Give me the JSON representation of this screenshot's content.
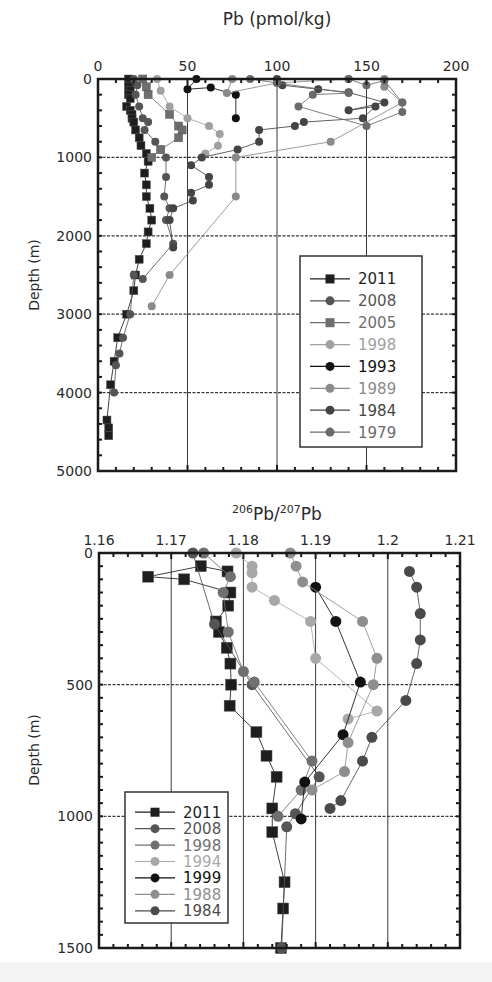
{
  "chart_data": [
    {
      "type": "line",
      "title": "Pb (pmol/kg)",
      "xlabel": "Pb (pmol/kg)",
      "ylabel": "Depth (m)",
      "xlim": [
        0,
        200
      ],
      "ylim": [
        5000,
        0
      ],
      "xticks": [
        0,
        50,
        100,
        150,
        200
      ],
      "yticks": [
        0,
        1000,
        2000,
        3000,
        4000,
        5000
      ],
      "grid": true,
      "legend_position": "lower right inside",
      "frame": {
        "left": 98,
        "top": 79,
        "right": 456,
        "bottom": 471
      },
      "legend_box": {
        "left": 300,
        "top": 256,
        "right": 422,
        "bottom": 447
      },
      "series": [
        {
          "name": "2011",
          "marker": "square",
          "color": "#1e1e1e",
          "points": [
            [
              17,
              0
            ],
            [
              18,
              50
            ],
            [
              17,
              100
            ],
            [
              18,
              150
            ],
            [
              17,
              200
            ],
            [
              18,
              250
            ],
            [
              16,
              350
            ],
            [
              18,
              400
            ],
            [
              19,
              450
            ],
            [
              19,
              500
            ],
            [
              20,
              550
            ],
            [
              21,
              650
            ],
            [
              23,
              750
            ],
            [
              24,
              850
            ],
            [
              27,
              950
            ],
            [
              28,
              1050
            ],
            [
              26,
              1200
            ],
            [
              27,
              1350
            ],
            [
              27,
              1500
            ],
            [
              29,
              1650
            ],
            [
              30,
              1800
            ],
            [
              28,
              1950
            ],
            [
              27,
              2100
            ],
            [
              23,
              2300
            ],
            [
              21,
              2500
            ],
            [
              20,
              2700
            ],
            [
              16,
              3000
            ],
            [
              11,
              3300
            ],
            [
              9,
              3600
            ],
            [
              7,
              3900
            ],
            [
              5,
              4350
            ],
            [
              6,
              4450
            ],
            [
              6,
              4550
            ]
          ]
        },
        {
          "name": "2008",
          "marker": "circle",
          "color": "#555555",
          "points": [
            [
              20,
              0
            ],
            [
              22,
              80
            ],
            [
              21,
              200
            ],
            [
              23,
              350
            ],
            [
              25,
              500
            ],
            [
              28,
              550
            ],
            [
              26,
              650
            ],
            [
              32,
              800
            ],
            [
              35,
              900
            ],
            [
              38,
              1000
            ],
            [
              38,
              1250
            ],
            [
              37,
              1500
            ],
            [
              40,
              1650
            ],
            [
              38,
              1800
            ],
            [
              42,
              2100
            ],
            [
              25,
              2550
            ],
            [
              20,
              2500
            ],
            [
              18,
              3000
            ],
            [
              14,
              3300
            ],
            [
              12,
              3500
            ],
            [
              10,
              3650
            ],
            [
              9,
              4000
            ]
          ]
        },
        {
          "name": "2005",
          "marker": "square",
          "color": "#6e6e6e",
          "points": [
            [
              25,
              0
            ],
            [
              27,
              100
            ],
            [
              28,
              200
            ],
            [
              40,
              450
            ],
            [
              45,
              600
            ],
            [
              47,
              650
            ],
            [
              45,
              750
            ],
            [
              35,
              900
            ],
            [
              30,
              1000
            ]
          ]
        },
        {
          "name": "1998",
          "marker": "circle",
          "color": "#a0a0a0",
          "points": [
            [
              33,
              0
            ],
            [
              35,
              150
            ],
            [
              40,
              350
            ],
            [
              50,
              500
            ],
            [
              62,
              600
            ],
            [
              68,
              700
            ],
            [
              67,
              850
            ],
            [
              60,
              950
            ]
          ]
        },
        {
          "name": "1993",
          "marker": "circle",
          "color": "#111111",
          "points": [
            [
              55,
              0
            ],
            [
              50,
              130
            ],
            [
              63,
              110
            ],
            [
              77,
              200
            ],
            [
              77,
              500
            ]
          ]
        },
        {
          "name": "1989",
          "marker": "circle",
          "color": "#8a8a8a",
          "points": [
            [
              75,
              0
            ],
            [
              72,
              180
            ],
            [
              100,
              50
            ],
            [
              140,
              0
            ],
            [
              160,
              0
            ],
            [
              160,
              100
            ],
            [
              170,
              300
            ],
            [
              130,
              800
            ],
            [
              77,
              1000
            ],
            [
              77,
              1500
            ],
            [
              40,
              2500
            ],
            [
              30,
              2900
            ]
          ]
        },
        {
          "name": "1984",
          "marker": "circle",
          "color": "#444444",
          "points": [
            [
              100,
              0
            ],
            [
              103,
              80
            ],
            [
              123,
              130
            ],
            [
              140,
              170
            ],
            [
              160,
              300
            ],
            [
              140,
              400
            ],
            [
              155,
              350
            ],
            [
              148,
              500
            ],
            [
              115,
              550
            ],
            [
              110,
              600
            ],
            [
              90,
              650
            ],
            [
              90,
              800
            ],
            [
              78,
              900
            ],
            [
              58,
              1000
            ],
            [
              52,
              1100
            ],
            [
              62,
              1250
            ],
            [
              62,
              1350
            ],
            [
              52,
              1450
            ],
            [
              53,
              1550
            ],
            [
              42,
              1650
            ],
            [
              40,
              1800
            ],
            [
              42,
              2150
            ]
          ]
        },
        {
          "name": "1979",
          "marker": "circle",
          "color": "#6a6a6a",
          "points": [
            [
              140,
              0
            ],
            [
              150,
              80
            ],
            [
              160,
              20
            ],
            [
              170,
              300
            ],
            [
              170,
              420
            ],
            [
              150,
              600
            ],
            [
              112,
              350
            ],
            [
              120,
              200
            ],
            [
              140,
              180
            ],
            [
              100,
              50
            ],
            [
              85,
              0
            ]
          ]
        }
      ]
    },
    {
      "type": "line",
      "title": "206Pb/207Pb",
      "xlabel": "206Pb/207Pb",
      "ylabel": "Depth (m)",
      "xlim": [
        1.16,
        1.21
      ],
      "ylim": [
        1500,
        0
      ],
      "xticks": [
        1.16,
        1.17,
        1.18,
        1.19,
        1.2,
        1.21
      ],
      "xtick_labels": [
        "1.16",
        "1.17",
        "1.18",
        "1.19",
        "1.2",
        "1.21"
      ],
      "yticks": [
        0,
        500,
        1000,
        1500
      ],
      "grid": true,
      "legend_position": "lower left inside",
      "frame": {
        "left": 99,
        "top": 553,
        "right": 460,
        "bottom": 948
      },
      "legend_box": {
        "left": 125,
        "top": 792,
        "right": 228,
        "bottom": 923
      },
      "series": [
        {
          "name": "2011",
          "marker": "square",
          "color": "#1e1e1e",
          "points": [
            [
              1.1778,
              70
            ],
            [
              1.1741,
              50
            ],
            [
              1.1668,
              90
            ],
            [
              1.1718,
              100
            ],
            [
              1.1782,
              150
            ],
            [
              1.1779,
              200
            ],
            [
              1.1762,
              260
            ],
            [
              1.1766,
              300
            ],
            [
              1.1777,
              360
            ],
            [
              1.1782,
              420
            ],
            [
              1.1783,
              500
            ],
            [
              1.1781,
              580
            ],
            [
              1.1818,
              680
            ],
            [
              1.1832,
              770
            ],
            [
              1.1846,
              850
            ],
            [
              1.184,
              970
            ],
            [
              1.184,
              1060
            ],
            [
              1.1857,
              1250
            ],
            [
              1.1855,
              1350
            ],
            [
              1.1852,
              1500
            ]
          ]
        },
        {
          "name": "2008",
          "marker": "circle",
          "color": "#555555",
          "points": [
            [
              1.173,
              0
            ],
            [
              1.176,
              270
            ],
            [
              1.1812,
              500
            ],
            [
              1.1905,
              850
            ],
            [
              1.1872,
              990
            ],
            [
              1.186,
              1040
            ],
            [
              1.1853,
              1500
            ]
          ]
        },
        {
          "name": "1998",
          "marker": "circle",
          "color": "#707070",
          "points": [
            [
              1.1745,
              0
            ],
            [
              1.1782,
              90
            ],
            [
              1.1772,
              150
            ],
            [
              1.1779,
              300
            ],
            [
              1.18,
              450
            ],
            [
              1.1815,
              490
            ],
            [
              1.1895,
              790
            ],
            [
              1.188,
              900
            ],
            [
              1.1848,
              1000
            ]
          ]
        },
        {
          "name": "1994",
          "marker": "circle",
          "color": "#a8a8a8",
          "points": [
            [
              1.179,
              0
            ],
            [
              1.1812,
              50
            ],
            [
              1.1812,
              75
            ],
            [
              1.1812,
              130
            ],
            [
              1.1843,
              180
            ],
            [
              1.1893,
              260
            ],
            [
              1.19,
              400
            ],
            [
              1.1985,
              600
            ],
            [
              1.1945,
              630
            ]
          ]
        },
        {
          "name": "1999",
          "marker": "circle",
          "color": "#111111",
          "points": [
            [
              1.19,
              130
            ],
            [
              1.1928,
              260
            ],
            [
              1.1962,
              490
            ],
            [
              1.1938,
              690
            ],
            [
              1.1885,
              870
            ],
            [
              1.188,
              1010
            ]
          ]
        },
        {
          "name": "1988",
          "marker": "circle",
          "color": "#8e8e8e",
          "points": [
            [
              1.1865,
              0
            ],
            [
              1.1873,
              50
            ],
            [
              1.1882,
              110
            ],
            [
              1.1965,
              260
            ],
            [
              1.1985,
              400
            ],
            [
              1.198,
              500
            ],
            [
              1.1945,
              720
            ],
            [
              1.194,
              830
            ],
            [
              1.1895,
              900
            ]
          ]
        },
        {
          "name": "1984",
          "marker": "circle",
          "color": "#4a4a4a",
          "points": [
            [
              1.203,
              70
            ],
            [
              1.204,
              130
            ],
            [
              1.2045,
              230
            ],
            [
              1.2045,
              330
            ],
            [
              1.204,
              420
            ],
            [
              1.2025,
              560
            ],
            [
              1.1978,
              700
            ],
            [
              1.1965,
              790
            ],
            [
              1.1935,
              940
            ],
            [
              1.192,
              970
            ]
          ]
        }
      ]
    }
  ],
  "plots": {
    "top": {
      "title": "Pb (pmol/kg)",
      "ylabel": "Depth (m)",
      "xtick_labels": [
        "0",
        "50",
        "100",
        "150",
        "200"
      ],
      "ytick_labels": [
        "0",
        "1000",
        "2000",
        "3000",
        "4000",
        "5000"
      ],
      "legend": [
        "2011",
        "2008",
        "2005",
        "1998",
        "1993",
        "1989",
        "1984",
        "1979"
      ]
    },
    "bottom": {
      "title_sup1": "206",
      "title_mid": "Pb/",
      "title_sup2": "207",
      "title_end": "Pb",
      "ylabel": "Depth (m)",
      "xtick_labels": [
        "1.16",
        "1.17",
        "1.18",
        "1.19",
        "1.2",
        "1.21"
      ],
      "ytick_labels": [
        "0",
        "500",
        "1000",
        "1500"
      ],
      "legend": [
        "2011",
        "2008",
        "1998",
        "1994",
        "1999",
        "1988",
        "1984"
      ]
    }
  }
}
